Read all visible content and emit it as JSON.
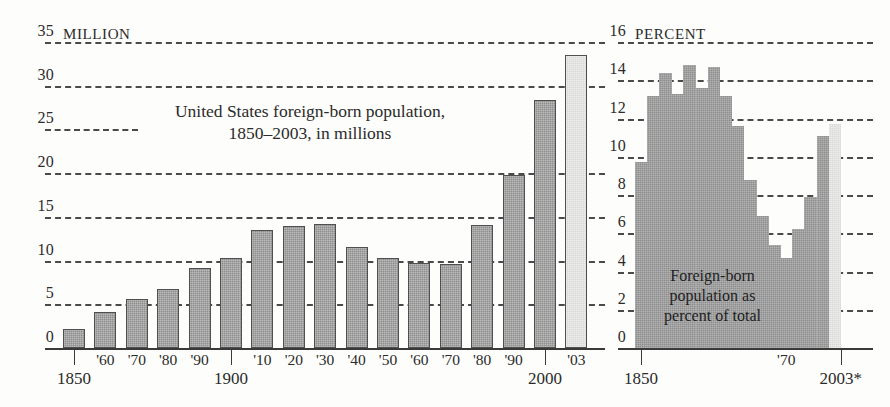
{
  "chart_data": [
    {
      "id": "foreign_born_millions",
      "type": "bar",
      "title": "United States foreign-born population,\n1850–2003, in millions",
      "unit_label": "MILLION",
      "xlabel": "",
      "ylabel": "",
      "ylim": [
        0,
        35
      ],
      "yticks": [
        0,
        5,
        10,
        15,
        20,
        25,
        30,
        35
      ],
      "ytick_labels": [
        "0",
        "5",
        "10",
        "15",
        "20",
        "25",
        "30",
        "35"
      ],
      "grid": true,
      "legend": "none",
      "categories": [
        "1850",
        "'60",
        "'70",
        "'80",
        "'90",
        "1900",
        "'10",
        "'20",
        "'30",
        "'40",
        "'50",
        "'60",
        "'70",
        "'80",
        "'90",
        "2000",
        "'03"
      ],
      "major_ticks": [
        "1850",
        "1900",
        "2000"
      ],
      "values": [
        2.2,
        4.1,
        5.6,
        6.7,
        9.2,
        10.3,
        13.5,
        13.9,
        14.2,
        11.6,
        10.3,
        9.7,
        9.6,
        14.1,
        19.8,
        28.4,
        33.5
      ],
      "highlight_index": 16,
      "colors": {
        "bar": "#8e8e8e",
        "bar_highlight": "#d8d8d6",
        "outline": "#4f4f4f",
        "grid": "#4a4a4a",
        "axis": "#3a3a3a"
      }
    },
    {
      "id": "foreign_born_percent",
      "type": "area",
      "title": "Foreign-born\npopulation as\npercent of total",
      "unit_label": "PERCENT",
      "xlabel": "",
      "ylabel": "",
      "ylim": [
        0,
        16
      ],
      "yticks": [
        0,
        2,
        4,
        6,
        8,
        10,
        12,
        14,
        16
      ],
      "ytick_labels": [
        "0",
        "2",
        "4",
        "6",
        "8",
        "10",
        "12",
        "14",
        "16"
      ],
      "grid": true,
      "legend": "none",
      "x": [
        "1850",
        "1860",
        "1870",
        "1880",
        "1890",
        "1900",
        "1910",
        "1920",
        "1930",
        "1940",
        "1950",
        "1960",
        "1970",
        "1980",
        "1990",
        "2000",
        "2003*"
      ],
      "xtick_labels": [
        "1850",
        "'70",
        "2003*"
      ],
      "values": [
        9.7,
        13.2,
        14.4,
        13.3,
        14.8,
        13.6,
        14.7,
        13.2,
        11.6,
        8.8,
        6.9,
        5.4,
        4.7,
        6.2,
        7.9,
        11.1,
        11.7
      ],
      "highlight_index": 16,
      "colors": {
        "area": "#8e8e8e",
        "area_highlight": "#d9d9d7",
        "grid": "#4a4a4a",
        "axis": "#3a3a3a"
      }
    }
  ],
  "left_chart": {
    "unit_label": "MILLION",
    "caption": "United States foreign-born population,\n1850–2003, in millions",
    "ytick_labels": [
      "0",
      "5",
      "10",
      "15",
      "20",
      "25",
      "30",
      "35"
    ],
    "xtick_labels": [
      "'60",
      "'70",
      "'80",
      "'90",
      "'10",
      "'20",
      "'30",
      "'40",
      "'50",
      "'60",
      "'70",
      "'80",
      "'90",
      "'03"
    ],
    "major_labels": [
      "1850",
      "1900",
      "2000"
    ]
  },
  "right_chart": {
    "unit_label": "PERCENT",
    "caption": "Foreign-born\npopulation as\npercent of total",
    "ytick_labels": [
      "0",
      "2",
      "4",
      "6",
      "8",
      "10",
      "12",
      "14",
      "16"
    ],
    "xtick_labels": [
      "1850",
      "'70",
      "2003*"
    ]
  }
}
